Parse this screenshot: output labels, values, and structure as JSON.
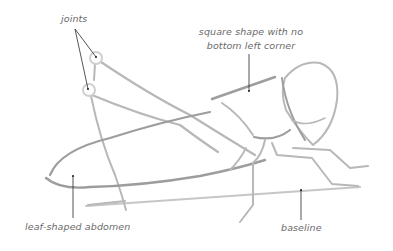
{
  "diagram": {
    "labels": {
      "joints": "joints",
      "square_shape_line1": "square shape with no",
      "square_shape_line2": "bottom left corner",
      "abdomen": "leaf-shaped abdomen",
      "baseline": "baseline"
    },
    "colors": {
      "sketch_line": "#b8b8b8",
      "sketch_line_dark": "#9d9d9d",
      "label_text": "#6a6a6a",
      "leader_line": "#2a2a2a",
      "background": "#ffffff"
    }
  }
}
